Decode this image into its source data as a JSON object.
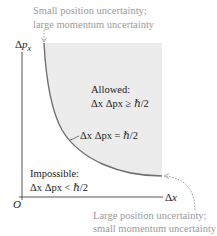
{
  "diagram": {
    "type": "uncertainty-principle-plot",
    "axes": {
      "y_label_delta": "Δ",
      "y_label_var": "p",
      "y_label_sub": "x",
      "x_label_delta": "Δ",
      "x_label_var": "x",
      "origin": "O"
    },
    "annotations": {
      "top_note_line1": "Small position uncertainty;",
      "top_note_line2": "large momentum uncertainty",
      "bottom_note_line1": "Large position uncertainty;",
      "bottom_note_line2": "small momentum uncertainty"
    },
    "regions": {
      "allowed_title": "Allowed:",
      "allowed_eq": "Δx Δpx ≥ ℏ/2",
      "boundary_eq": "Δx Δpx = ℏ/2",
      "impossible_title": "Impossible:",
      "impossible_eq": "Δx Δpx < ℏ/2"
    },
    "colors": {
      "shaded_region": "#ececec",
      "curve": "#707070",
      "axis": "#333333",
      "note_text": "#9a9a9a"
    }
  }
}
